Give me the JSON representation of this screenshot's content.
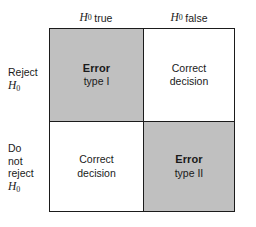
{
  "figure": {
    "kind": "hypothesis-testing-decision-matrix",
    "shaded_color": "#c0c0c0",
    "plain_color": "#ffffff",
    "border_color": "#1b1b1b"
  },
  "columns": [
    {
      "symbol": "H",
      "subscript": "0",
      "word": "true"
    },
    {
      "symbol": "H",
      "subscript": "0",
      "word": "false"
    }
  ],
  "rows": [
    {
      "lines": [
        "Reject"
      ],
      "symbol": "H",
      "subscript": "0"
    },
    {
      "lines": [
        "Do",
        "not",
        "reject"
      ],
      "symbol": "H",
      "subscript": "0"
    }
  ],
  "cells": {
    "top_left": {
      "title": "Error",
      "sub": "type I",
      "shaded": true
    },
    "top_right": {
      "line1": "Correct",
      "line2": "decision",
      "shaded": false
    },
    "bottom_left": {
      "line1": "Correct",
      "line2": "decision",
      "shaded": false
    },
    "bottom_right": {
      "title": "Error",
      "sub": "type II",
      "shaded": true
    }
  }
}
